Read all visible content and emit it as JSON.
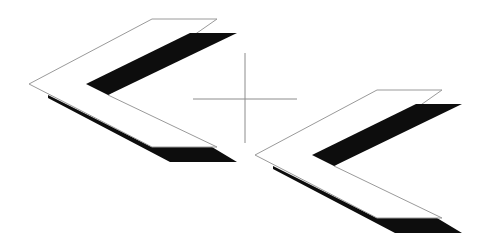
{
  "canvas": {
    "width": 483,
    "height": 250,
    "background": "#ffffff"
  },
  "colors": {
    "outline": "#9a9a9a",
    "fill_black": "#0d0d0d",
    "crosshair": "#8c8c8c"
  },
  "crosshair": {
    "center": [
      245,
      99
    ],
    "horizontal": {
      "x1": 193,
      "x2": 297,
      "y": 99
    },
    "vertical": {
      "x": 245,
      "y1": 53,
      "y2": 143
    }
  },
  "chevrons": [
    {
      "id": "chevron-left",
      "outline_points": "29,84 152,19 217,19 108,95 217,147 152,147",
      "black_band_points": "86,84 190,33 237,33 108,95",
      "shadow_points": "48,95 152,147 212,147 237,162 170,162 48,98"
    },
    {
      "id": "chevron-right",
      "outline_points": "255,155 377,90 442,90 334,166 442,218 377,218",
      "black_band_points": "312,155 416,104 462,104 334,166",
      "shadow_points": "273,166 377,218 437,218 462,233 395,233 273,169"
    }
  ]
}
